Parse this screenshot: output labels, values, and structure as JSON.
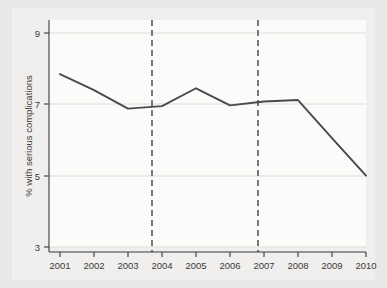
{
  "chart_data": {
    "type": "line",
    "title": "",
    "subtitle": "",
    "xlabel": "",
    "ylabel": "% with serious complications",
    "x": [
      2001,
      2002,
      2003,
      2004,
      2005,
      2006,
      2007,
      2008,
      2009,
      2010
    ],
    "categories": [
      "2001",
      "2002",
      "2003",
      "2004",
      "2005",
      "2006",
      "2007",
      "2008",
      "2009",
      "2010"
    ],
    "values": [
      7.85,
      7.4,
      6.88,
      6.95,
      7.45,
      6.97,
      7.08,
      7.12,
      6.05,
      5.0
    ],
    "series": [
      {
        "name": "% with serious complications",
        "values": [
          7.85,
          7.4,
          6.88,
          6.95,
          7.45,
          6.97,
          7.08,
          7.12,
          6.05,
          5.0
        ]
      }
    ],
    "xlim": [
      2000.7,
      2010.3
    ],
    "ylim": [
      2.8,
      9.2
    ],
    "yticks": [
      3,
      5,
      7,
      9
    ],
    "ytick_labels": [
      "3",
      "5",
      "7",
      "9"
    ],
    "xticks": [
      2001,
      2002,
      2003,
      2004,
      2005,
      2006,
      2007,
      2008,
      2009,
      2010
    ],
    "xtick_labels": [
      "2001",
      "2002",
      "2003",
      "2004",
      "2005",
      "2006",
      "2007",
      "2008",
      "2009",
      "2010"
    ],
    "grid": "horizontal",
    "legend": "none",
    "annotations": [
      {
        "type": "vline",
        "x": 2004,
        "style": "dashed"
      },
      {
        "type": "vline",
        "x": 2007,
        "style": "dashed"
      }
    ],
    "colors": {
      "line": "#4a4a4a",
      "vline": "#6b6b6b",
      "grid": "#dcdcd8",
      "axis": "#3a3a3a",
      "plot_bg": "#fbfbfa",
      "figure_bg": "#f0efed",
      "page_bg": "#e8e8e6"
    }
  }
}
